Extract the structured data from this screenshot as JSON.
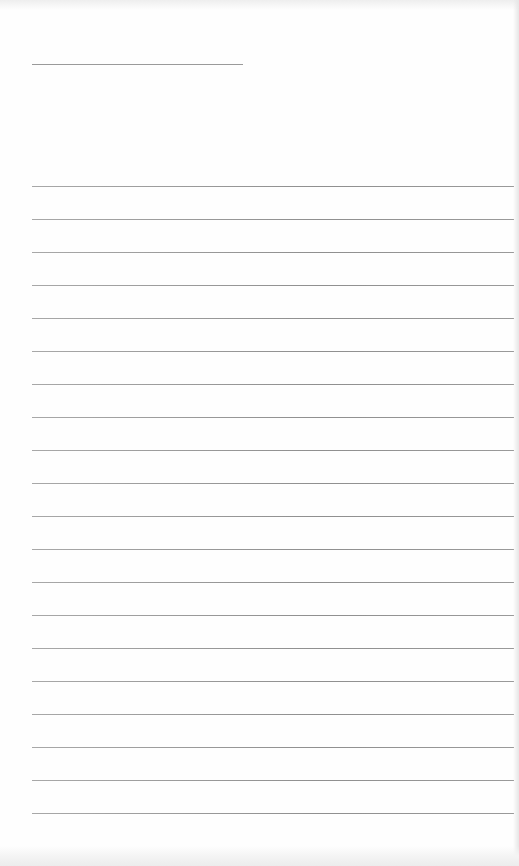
{
  "page": {
    "type": "lined-paper",
    "background": "#fefefe",
    "line_color": "#9a9a9a",
    "header_line": {
      "top": 64,
      "left": 32,
      "width": 211
    },
    "rules": {
      "count": 20,
      "first_top": 186,
      "spacing": 33,
      "left": 32,
      "width": 482
    }
  }
}
